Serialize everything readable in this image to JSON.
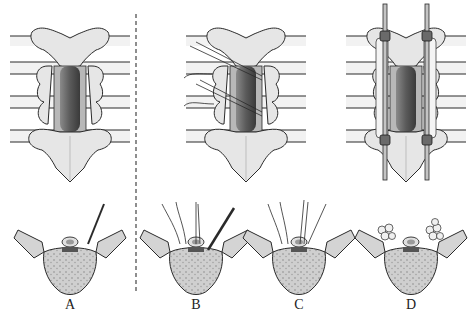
{
  "figure": {
    "panels": [
      {
        "id": "A",
        "label": "A",
        "x": 70
      },
      {
        "id": "B",
        "label": "B",
        "x": 196
      },
      {
        "id": "C",
        "label": "C",
        "x": 299
      },
      {
        "id": "D",
        "label": "D",
        "x": 411
      }
    ],
    "colors": {
      "bone": "#e4e4e4",
      "bone_shade": "#c8c8c8",
      "outline": "#2a2a2a",
      "dura": "#6e6e6e",
      "vertebral_body": "#d8d8d8",
      "divider": "#444444"
    }
  }
}
